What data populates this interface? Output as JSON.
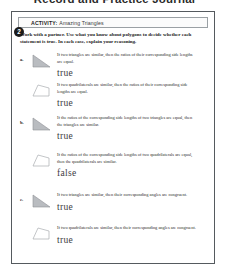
{
  "page": {
    "title": "Record and Practice Journal"
  },
  "activity": {
    "number": "2",
    "label": "ACTIVITY:",
    "name": "Amazing Triangles",
    "directions": "Work with a partner. Use what you know about polygons to decide whether each statement is true. In each case, explain your reasoning."
  },
  "items": [
    {
      "letter": "a.",
      "figure": "triangle-shape",
      "statements": [
        {
          "text": "If two triangles are similar, then the ratios of their corresponding side lengths are equal.",
          "answer": "true",
          "figure": "triangle-shape"
        },
        {
          "text": "If two quadrilaterals are similar, then the ratios of their corresponding side lengths are equal.",
          "answer": "true",
          "figure": "quadrilateral-shape"
        }
      ]
    },
    {
      "letter": "b.",
      "statements": [
        {
          "text": "If the ratios of the corresponding side lengths of two triangles are equal, then the triangles are similar.",
          "answer": "true",
          "figure": "triangle-shape"
        },
        {
          "text": "If the ratios of the corresponding side lengths of two quadrilaterals are equal, then the quadrilaterals are similar.",
          "answer": "false",
          "figure": "quadrilateral-shape"
        }
      ]
    },
    {
      "letter": "c.",
      "statements": [
        {
          "text": "If two triangles are similar, then their corresponding angles are congruent.",
          "answer": "true",
          "figure": "triangle-shape"
        },
        {
          "text": "If two quadrilaterals are similar, then their corresponding angles are congruent.",
          "answer": "true",
          "figure": "quadrilateral-shape"
        }
      ]
    }
  ],
  "colors": {
    "figure_fill": "#b9bcc0",
    "figure_stroke": "#8e9195",
    "page_border": "#555a5e",
    "badge": "#1b1b1b",
    "answer_ink": "#3c3c42"
  }
}
